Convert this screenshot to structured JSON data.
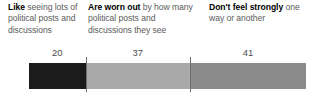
{
  "chart_data": {
    "type": "bar",
    "orientation": "horizontal-stacked",
    "title": "",
    "subtitle": "",
    "xlabel": "",
    "ylabel": "",
    "grid": false,
    "legend": "top-as-column-headings",
    "units": "percent",
    "total": 98,
    "categories": [
      "Like seeing lots of political posts and discussions",
      "Are worn out by how many political posts and discussions they see",
      "Don't feel strongly one way or another"
    ],
    "values": [
      20,
      37,
      41
    ],
    "value_labels": [
      "20",
      "37",
      "41"
    ],
    "colors": [
      "#1b1b1b",
      "#a9a9a9",
      "#8b8b8b"
    ]
  },
  "segments": [
    {
      "lead": "Like",
      "rest": " seeing lots of political posts and discussions",
      "value_label": "20",
      "color": "#1b1b1b"
    },
    {
      "lead": "Are worn out",
      "rest": " by how many political posts and discussions they see",
      "value_label": "37",
      "color": "#a9a9a9"
    },
    {
      "lead": "Don't feel strongly",
      "rest": " one way or another",
      "value_label": "41",
      "color": "#8b8b8b"
    }
  ],
  "styles": {
    "background": "#ffffff",
    "label_lead_color": "#000000",
    "label_rest_color": "#5b5b5b",
    "value_color": "#4a4a4a",
    "tick_color": "#6e6e6e"
  }
}
